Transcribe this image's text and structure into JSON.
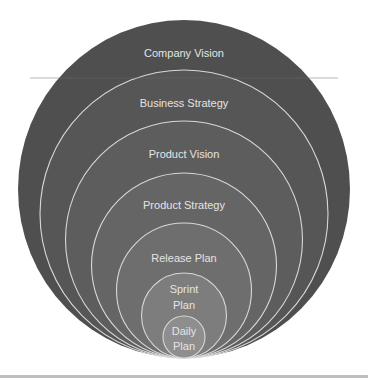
{
  "diagram": {
    "levels": [
      {
        "label_lines": [
          "Company Vision"
        ],
        "fill": "#4f4f4f",
        "top": 20,
        "label_y": [
          57
        ]
      },
      {
        "label_lines": [
          "Business Strategy"
        ],
        "fill": "#565656",
        "top": 70,
        "label_y": [
          107
        ]
      },
      {
        "label_lines": [
          "Product Vision"
        ],
        "fill": "#5d5d5d",
        "top": 121,
        "label_y": [
          158
        ]
      },
      {
        "label_lines": [
          "Product Strategy"
        ],
        "fill": "#656565",
        "top": 173,
        "label_y": [
          209
        ]
      },
      {
        "label_lines": [
          "Release Plan"
        ],
        "fill": "#6e6e6e",
        "top": 223,
        "label_y": [
          262
        ]
      },
      {
        "label_lines": [
          "Sprint",
          "Plan"
        ],
        "fill": "#7d7d7d",
        "top": 273,
        "label_y": [
          293,
          309
        ]
      },
      {
        "label_lines": [
          "Daily",
          "Plan"
        ],
        "fill": "#8e8e8e",
        "top": 316,
        "label_y": [
          335,
          350
        ]
      }
    ],
    "bottom_y": 358,
    "center_x": 184,
    "stroke": "#d8d8d8"
  }
}
